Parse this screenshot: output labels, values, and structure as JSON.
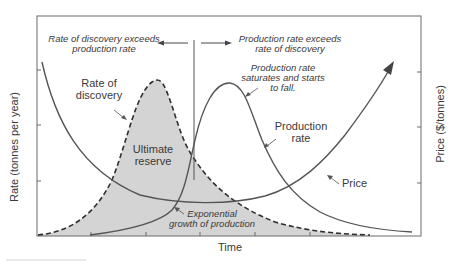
{
  "diagram": {
    "y_axis_left_label": "Rate  (tonnes per year)",
    "y_axis_right_label": "Price ($/tonnes)",
    "x_axis_label": "Time",
    "annotations": {
      "left_region_line1": "Rate of discovery exceeds",
      "left_region_line2": "production rate",
      "right_region_line1": "Production rate exceeds",
      "right_region_line2": "rate of discovery",
      "saturates_line1": "Production rate",
      "saturates_line2": "saturates and starts",
      "saturates_line3": "to fall.",
      "exponential_line1": "Exponential",
      "exponential_line2": "growth of production"
    },
    "curve_labels": {
      "discovery_line1": "Rate of",
      "discovery_line2": "discovery",
      "production_line1": "Production",
      "production_line2": "rate",
      "price": "Price",
      "reserve_line1": "Ultimate",
      "reserve_line2": "reserve"
    },
    "colors": {
      "line": "#4a4a4a",
      "fill": "#d4d4d4",
      "frame": "#6a6a6a",
      "text": "#3a3a3a"
    },
    "series": [
      {
        "name": "Rate of discovery",
        "style": "dashed",
        "shape": "bell curve peaking early, shaded area beneath = Ultimate reserve"
      },
      {
        "name": "Production rate",
        "style": "solid",
        "shape": "exponential rise, peak later, then decline"
      },
      {
        "name": "Price",
        "style": "solid",
        "shape": "high, falls to minimum near peak production, then rises with arrow"
      }
    ]
  }
}
